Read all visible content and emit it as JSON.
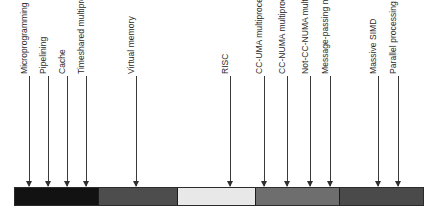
{
  "figure": {
    "type": "timeline",
    "title": "",
    "orientation": "horizontal",
    "bar": {
      "left_px": 14,
      "right_px": 424,
      "segments": [
        {
          "name": "segment-1",
          "color": "#121212",
          "start_px": 14,
          "end_px": 98
        },
        {
          "name": "segment-2",
          "color": "#4d4d4d",
          "start_px": 98,
          "end_px": 178
        },
        {
          "name": "segment-3",
          "color": "#e8e8e8",
          "start_px": 178,
          "end_px": 256
        },
        {
          "name": "segment-4",
          "color": "#6e6e6e",
          "start_px": 256,
          "end_px": 341
        },
        {
          "name": "segment-5",
          "color": "#4a4a4a",
          "start_px": 341,
          "end_px": 424
        }
      ]
    },
    "markers": [
      {
        "id": "microprogramming",
        "label": "Microprogramming",
        "x_px": 29,
        "tick_height_px": 110
      },
      {
        "id": "pipelining",
        "label": "Pipelining",
        "x_px": 48,
        "tick_height_px": 110
      },
      {
        "id": "cache",
        "label": "Cache",
        "x_px": 67,
        "tick_height_px": 110
      },
      {
        "id": "timeshared-multiprocessor",
        "label": "Timeshared multiprocessor",
        "x_px": 86,
        "tick_height_px": 110
      },
      {
        "id": "virtual-memory",
        "label": "Virtual memory",
        "x_px": 136,
        "tick_height_px": 110
      },
      {
        "id": "risc",
        "label": "RISC",
        "x_px": 230,
        "tick_height_px": 110
      },
      {
        "id": "cc-uma-multiprocessor",
        "label": "CC-UMA multiprocessor",
        "x_px": 264,
        "tick_height_px": 110
      },
      {
        "id": "cc-numa-multiprocessor",
        "label": "CC-NUMA multiprocessor",
        "x_px": 287,
        "tick_height_px": 110
      },
      {
        "id": "not-cc-numa-multiprocessor",
        "label": "Not-CC-NUMA multiprocessor",
        "x_px": 310,
        "tick_height_px": 110
      },
      {
        "id": "message-passing-multiprocessor",
        "label": "Message-passing multiprocessor",
        "x_px": 330,
        "tick_height_px": 110
      },
      {
        "id": "massive-simd",
        "label": "Massive SIMD",
        "x_px": 378,
        "tick_height_px": 110
      },
      {
        "id": "parallel-processing-multiprocessor",
        "label": "Parallel processing multiprocessor",
        "x_px": 398,
        "tick_height_px": 110
      }
    ]
  }
}
